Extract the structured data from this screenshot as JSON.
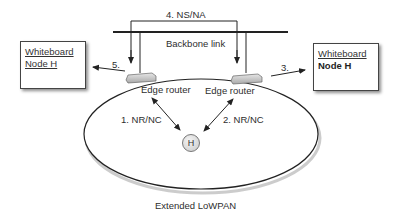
{
  "diagram": {
    "backbone_label": "Backbone link",
    "ns_na_label": "4. NS/NA",
    "step3_label": "3.",
    "step5_label": "5.",
    "left_router_label": "Edge router",
    "right_router_label": "Edge router",
    "nrnc1_label": "1. NR/NC",
    "nrnc2_label": "2. NR/NC",
    "host_label": "H",
    "lowpan_label": "Extended LoWPAN",
    "left_whiteboard": {
      "title": "Whiteboard",
      "node": "Node H"
    },
    "right_whiteboard": {
      "title": "Whiteboard",
      "node": "Node H"
    }
  }
}
